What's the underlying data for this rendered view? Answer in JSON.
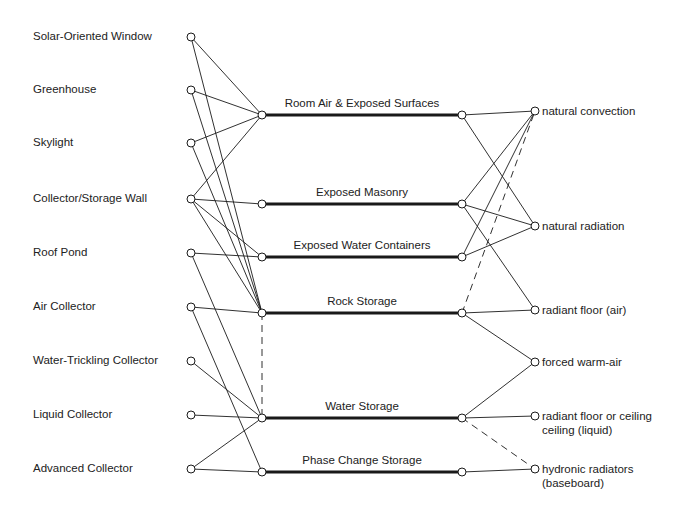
{
  "title": "",
  "colors": {
    "line": "#1a1a1a",
    "background": "#ffffff",
    "node_fill": "#ffffff"
  },
  "sources": [
    {
      "id": "s0",
      "label": "Solar-Oriented Window",
      "x": 191,
      "y": 37
    },
    {
      "id": "s1",
      "label": "Greenhouse",
      "x": 191,
      "y": 90
    },
    {
      "id": "s2",
      "label": "Skylight",
      "x": 191,
      "y": 143
    },
    {
      "id": "s3",
      "label": "Collector/Storage Wall",
      "x": 191,
      "y": 199
    },
    {
      "id": "s4",
      "label": "Roof Pond",
      "x": 191,
      "y": 253
    },
    {
      "id": "s5",
      "label": "Air Collector",
      "x": 191,
      "y": 307
    },
    {
      "id": "s6",
      "label": "Water-Trickling Collector",
      "x": 191,
      "y": 361
    },
    {
      "id": "s7",
      "label": "Liquid Collector",
      "x": 191,
      "y": 415
    },
    {
      "id": "s8",
      "label": "Advanced Collector",
      "x": 191,
      "y": 469
    }
  ],
  "storage": [
    {
      "id": "m0",
      "label": "Room Air & Exposed Surfaces",
      "x1": 262,
      "x2": 462,
      "y": 115
    },
    {
      "id": "m1",
      "label": "Exposed Masonry",
      "x1": 262,
      "x2": 462,
      "y": 204
    },
    {
      "id": "m2",
      "label": "Exposed Water Containers",
      "x1": 262,
      "x2": 462,
      "y": 257
    },
    {
      "id": "m3",
      "label": "Rock Storage",
      "x1": 262,
      "x2": 462,
      "y": 313
    },
    {
      "id": "m4",
      "label": "Water Storage",
      "x1": 262,
      "x2": 462,
      "y": 418
    },
    {
      "id": "m5",
      "label": "Phase Change Storage",
      "x1": 262,
      "x2": 462,
      "y": 472
    }
  ],
  "distribution": [
    {
      "id": "d0",
      "lines": [
        "natural convection"
      ],
      "x": 535,
      "y": 111
    },
    {
      "id": "d1",
      "lines": [
        "natural radiation"
      ],
      "x": 535,
      "y": 226
    },
    {
      "id": "d2",
      "lines": [
        "radiant floor (air)"
      ],
      "x": 535,
      "y": 310
    },
    {
      "id": "d3",
      "lines": [
        "forced warm-air"
      ],
      "x": 535,
      "y": 362
    },
    {
      "id": "d4",
      "lines": [
        "radiant floor or ceiling",
        "ceiling (liquid)"
      ],
      "x": 535,
      "y": 416
    },
    {
      "id": "d5",
      "lines": [
        "hydronic radiators",
        "(baseboard)"
      ],
      "x": 535,
      "y": 469
    }
  ],
  "edges": [
    {
      "from": "s0",
      "to": "m0",
      "style": "solid"
    },
    {
      "from": "s0",
      "to": "m3",
      "style": "solid"
    },
    {
      "from": "s1",
      "to": "m0",
      "style": "solid"
    },
    {
      "from": "s1",
      "to": "m3",
      "style": "solid"
    },
    {
      "from": "s2",
      "to": "m0",
      "style": "solid"
    },
    {
      "from": "s2",
      "to": "m3",
      "style": "solid"
    },
    {
      "from": "s3",
      "to": "m0",
      "style": "solid"
    },
    {
      "from": "s3",
      "to": "m1",
      "style": "solid"
    },
    {
      "from": "s3",
      "to": "m2",
      "style": "solid"
    },
    {
      "from": "s3",
      "to": "m3",
      "style": "solid"
    },
    {
      "from": "s4",
      "to": "m2",
      "style": "solid"
    },
    {
      "from": "s4",
      "to": "m4",
      "style": "solid"
    },
    {
      "from": "s5",
      "to": "m3",
      "style": "solid"
    },
    {
      "from": "s5",
      "to": "m5",
      "style": "solid"
    },
    {
      "from": "s6",
      "to": "m4",
      "style": "solid"
    },
    {
      "from": "s7",
      "to": "m4",
      "style": "solid"
    },
    {
      "from": "s8",
      "to": "m4",
      "style": "solid"
    },
    {
      "from": "s8",
      "to": "m5",
      "style": "solid"
    },
    {
      "from": "m3",
      "to": "m4",
      "style": "dashed",
      "side": "left"
    },
    {
      "from": "m0",
      "to": "d0",
      "style": "solid"
    },
    {
      "from": "m0",
      "to": "d1",
      "style": "solid"
    },
    {
      "from": "m1",
      "to": "d0",
      "style": "solid"
    },
    {
      "from": "m1",
      "to": "d1",
      "style": "solid"
    },
    {
      "from": "m1",
      "to": "d2",
      "style": "solid"
    },
    {
      "from": "m2",
      "to": "d0",
      "style": "solid"
    },
    {
      "from": "m2",
      "to": "d1",
      "style": "solid"
    },
    {
      "from": "m3",
      "to": "d0",
      "style": "dashed"
    },
    {
      "from": "m3",
      "to": "d2",
      "style": "solid"
    },
    {
      "from": "m3",
      "to": "d3",
      "style": "solid"
    },
    {
      "from": "m4",
      "to": "d3",
      "style": "solid"
    },
    {
      "from": "m4",
      "to": "d4",
      "style": "solid"
    },
    {
      "from": "m4",
      "to": "d5",
      "style": "dashed"
    },
    {
      "from": "m5",
      "to": "d5",
      "style": "solid"
    }
  ]
}
